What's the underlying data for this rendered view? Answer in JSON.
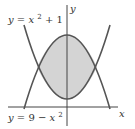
{
  "figure": {
    "type": "region-between-curves",
    "axes": {
      "x_label": "x",
      "y_label": "y"
    },
    "curves": [
      {
        "name": "upper-parabola-label",
        "label_lhs": "y",
        "label_eq": "=",
        "label_var": "x",
        "label_exp": "2",
        "label_rest": " + 1",
        "equation": "y = x^2 + 1"
      },
      {
        "name": "lower-parabola-label",
        "label_lhs": "y",
        "label_eq": "= 9 − ",
        "label_var": "x",
        "label_exp": "2",
        "equation": "y = 9 - x^2"
      }
    ],
    "shaded_region": "between y = x^2 + 1 and y = 9 - x^2, from x = -2 to x = 2",
    "intersections": [
      [
        -2,
        5
      ],
      [
        2,
        5
      ]
    ],
    "colors": {
      "curve": "#555555",
      "axis": "#444444",
      "fill": "#d4d4d4",
      "text": "#333333"
    }
  }
}
